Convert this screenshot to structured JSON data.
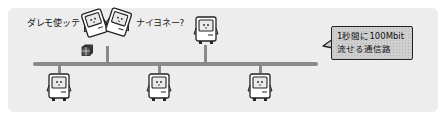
{
  "diagram": {
    "speech": {
      "left": "ダレモ使ッテ",
      "right": "ナイヨネー?"
    },
    "callout": {
      "line1": "1秒間に100Mbit",
      "line2": "流せる通信路"
    },
    "nodes": [
      {
        "id": "pc-top-1",
        "position": "top",
        "state": "tilted-left"
      },
      {
        "id": "pc-top-2",
        "position": "top",
        "state": "tilted-right"
      },
      {
        "id": "pc-top-3",
        "position": "top",
        "state": "upright"
      },
      {
        "id": "pc-bottom-1",
        "position": "bottom",
        "state": "upright"
      },
      {
        "id": "pc-bottom-2",
        "position": "bottom",
        "state": "upright"
      },
      {
        "id": "pc-bottom-3",
        "position": "bottom",
        "state": "upright"
      }
    ],
    "package_icon": "package-icon",
    "colors": {
      "background": "#ededed",
      "bus": "#8a8a8a",
      "callout_fill": "#cfcfcf",
      "outline": "#222222"
    }
  }
}
